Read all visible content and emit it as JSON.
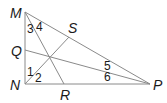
{
  "diagram": {
    "type": "geometry",
    "vertices": {
      "M": {
        "label": "M",
        "x": 25,
        "y": 12
      },
      "N": {
        "label": "N",
        "x": 25,
        "y": 84
      },
      "P": {
        "label": "P",
        "x": 150,
        "y": 84
      },
      "Q": {
        "label": "Q",
        "x": 25,
        "y": 50
      },
      "S": {
        "label": "S",
        "x": 69,
        "y": 36
      },
      "R": {
        "label": "R",
        "x": 64,
        "y": 84
      }
    },
    "segments": [
      [
        "M",
        "N"
      ],
      [
        "N",
        "P"
      ],
      [
        "M",
        "P"
      ],
      [
        "M",
        "R"
      ],
      [
        "N",
        "S"
      ],
      [
        "Q",
        "P"
      ]
    ],
    "angle_labels": [
      "1",
      "2",
      "3",
      "4",
      "5",
      "6"
    ],
    "colors": {
      "line": "#8a8a8a",
      "text": "#1a1a1a",
      "background": "#ffffff"
    }
  }
}
